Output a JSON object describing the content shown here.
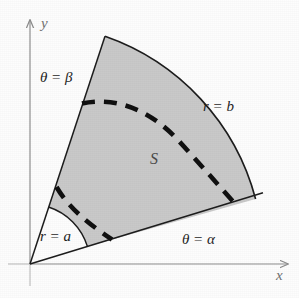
{
  "figure": {
    "region_label": "S",
    "axes": {
      "x_label": "x",
      "y_label": "y",
      "axis_color": "#8c8c8c"
    },
    "boundaries": {
      "inner_radius_label": "r = a",
      "outer_radius_label": "r = b",
      "lower_angle_label": "θ = α",
      "upper_angle_label": "θ = β"
    },
    "colors": {
      "shaded_fill": "#c9c9c9",
      "outline": "#1d1d1d",
      "dashed_curve": "#101010",
      "label_text": "#1d1d1d"
    },
    "geometry": {
      "origin_x": 30,
      "origin_y": 264,
      "inner_radius": 60,
      "outer_radius": 236,
      "alpha_degrees": 17,
      "beta_degrees": 72
    }
  }
}
